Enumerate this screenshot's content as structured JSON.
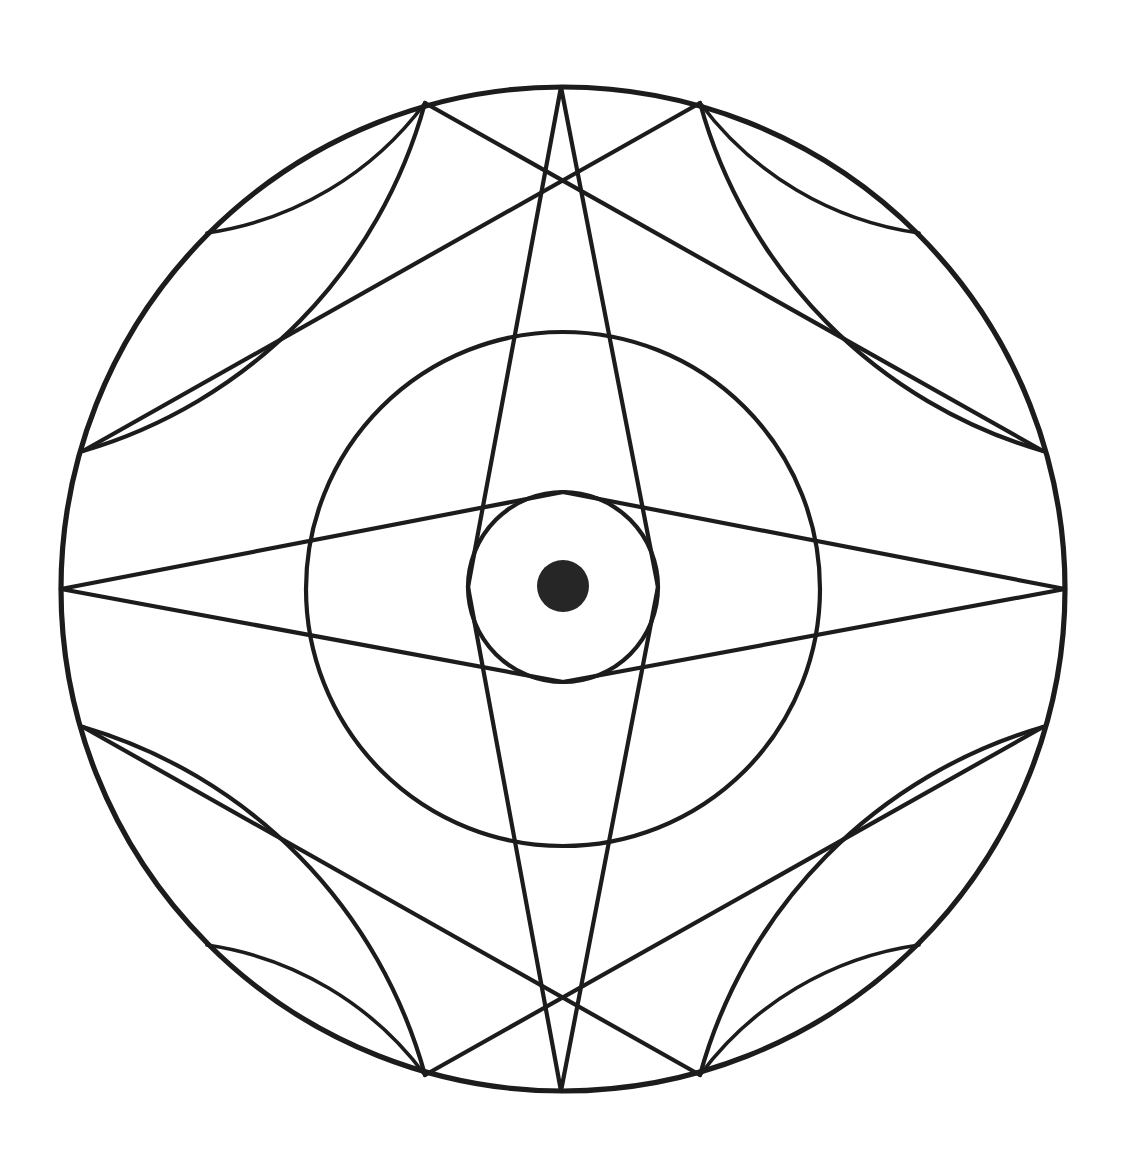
{
  "document": {
    "title": "Geometric Mandala Line Drawing",
    "kind": "diagram",
    "background_color": "#ffffff",
    "stroke_color": "#1c1c1c",
    "fill_color": "#262626",
    "canvas": {
      "width": 1127,
      "height": 1168
    }
  },
  "figure": {
    "name": "concentric-circle-mandala",
    "symmetry": "4-fold with horizontal and vertical mirror axes",
    "center": {
      "x": 563,
      "y": 589
    }
  },
  "chart_data": {
    "type": "diagram",
    "xlabel": "",
    "ylabel": "",
    "grid": false,
    "legend": "none",
    "center": {
      "x": 563,
      "y": 589
    },
    "circles": [
      {
        "name": "outer-circle",
        "cx": 563,
        "cy": 589,
        "r": 502,
        "stroke_width": 5.2
      },
      {
        "name": "medium-circle",
        "cx": 563,
        "cy": 589,
        "r": 257,
        "stroke_width": 4.2
      },
      {
        "name": "small-circle",
        "cx": 563,
        "cy": 587,
        "r": 95,
        "stroke_width": 4.2
      },
      {
        "name": "center-dot",
        "cx": 563,
        "cy": 586,
        "r": 26,
        "filled": true
      }
    ],
    "vertices": [
      {
        "name": "top",
        "x": 561,
        "y": 87,
        "angle_deg": 270
      },
      {
        "name": "bottom",
        "x": 561,
        "y": 1091,
        "angle_deg": 90
      },
      {
        "name": "left",
        "x": 61,
        "y": 589,
        "angle_deg": 180
      },
      {
        "name": "right",
        "x": 1065,
        "y": 589,
        "angle_deg": 0
      },
      {
        "name": "upper-left-outer",
        "x": 207,
        "y": 233,
        "angle_deg": 225
      },
      {
        "name": "upper-right-outer",
        "x": 919,
        "y": 233,
        "angle_deg": 315
      },
      {
        "name": "lower-left-outer",
        "x": 207,
        "y": 945,
        "angle_deg": 135
      },
      {
        "name": "lower-right-outer",
        "x": 919,
        "y": 945,
        "angle_deg": 45
      },
      {
        "name": "top-left-upper",
        "x": 425,
        "y": 103,
        "angle_deg": 256
      },
      {
        "name": "top-right-upper",
        "x": 700,
        "y": 103,
        "angle_deg": 284
      },
      {
        "name": "bottom-left-lower",
        "x": 425,
        "y": 1075,
        "angle_deg": 104
      },
      {
        "name": "bottom-right-lower",
        "x": 700,
        "y": 1075,
        "angle_deg": 76
      },
      {
        "name": "left-upper",
        "x": 83,
        "y": 451,
        "angle_deg": 196
      },
      {
        "name": "left-lower",
        "x": 83,
        "y": 727,
        "angle_deg": 164
      },
      {
        "name": "right-upper",
        "x": 1043,
        "y": 451,
        "angle_deg": 344
      },
      {
        "name": "right-lower",
        "x": 1043,
        "y": 727,
        "angle_deg": 16
      }
    ],
    "petal_arcs": [
      {
        "name": "petal-top-left-outer",
        "from": [
          425,
          103
        ],
        "to": [
          83,
          451
        ],
        "radius": 500,
        "sweep": 1
      },
      {
        "name": "petal-top-left-inner",
        "from": [
          425,
          103
        ],
        "to": [
          207,
          233
        ],
        "radius": 330,
        "sweep": 1
      },
      {
        "name": "petal-top-right-outer",
        "from": [
          700,
          103
        ],
        "to": [
          1043,
          451
        ],
        "radius": 500,
        "sweep": 0
      },
      {
        "name": "petal-top-right-inner",
        "from": [
          700,
          103
        ],
        "to": [
          919,
          233
        ],
        "radius": 330,
        "sweep": 0
      },
      {
        "name": "petal-bottom-left-outer",
        "from": [
          425,
          1075
        ],
        "to": [
          83,
          727
        ],
        "radius": 500,
        "sweep": 0
      },
      {
        "name": "petal-bottom-left-inner",
        "from": [
          425,
          1075
        ],
        "to": [
          207,
          945
        ],
        "radius": 330,
        "sweep": 0
      },
      {
        "name": "petal-bottom-right-outer",
        "from": [
          700,
          1075
        ],
        "to": [
          1043,
          727
        ],
        "radius": 500,
        "sweep": 1
      },
      {
        "name": "petal-bottom-right-inner",
        "from": [
          700,
          1075
        ],
        "to": [
          919,
          945
        ],
        "radius": 330,
        "sweep": 1
      }
    ],
    "chord_lines": [
      {
        "name": "vertical-lens-left",
        "from": [
          561,
          87
        ],
        "to": [
          561,
          1091
        ],
        "tangent_to": "small-circle",
        "side": "left"
      },
      {
        "name": "vertical-lens-right",
        "from": [
          561,
          87
        ],
        "to": [
          561,
          1091
        ],
        "tangent_to": "small-circle",
        "side": "right"
      },
      {
        "name": "horizontal-lens-upper",
        "from": [
          61,
          589
        ],
        "to": [
          1065,
          589
        ],
        "tangent_to": "small-circle",
        "side": "upper"
      },
      {
        "name": "horizontal-lens-lower",
        "from": [
          61,
          589
        ],
        "to": [
          1065,
          589
        ],
        "tangent_to": "small-circle",
        "side": "lower"
      },
      {
        "name": "spoke-upper-left",
        "from": [
          83,
          451
        ],
        "to": [
          700,
          103
        ]
      },
      {
        "name": "spoke-upper-right",
        "from": [
          1043,
          451
        ],
        "to": [
          425,
          103
        ]
      },
      {
        "name": "spoke-lower-left",
        "from": [
          83,
          727
        ],
        "to": [
          700,
          1075
        ]
      },
      {
        "name": "spoke-lower-right",
        "from": [
          1043,
          727
        ],
        "to": [
          425,
          1075
        ]
      }
    ],
    "counts": {
      "concentric_circles": 3,
      "filled_dot": 1,
      "large_petals": 4,
      "straight_chords": 8,
      "outer_vertices": 16
    }
  }
}
